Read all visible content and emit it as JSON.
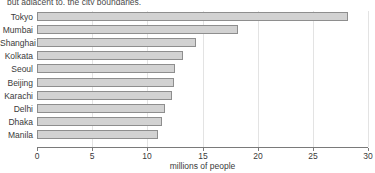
{
  "caption": {
    "text": "but adjacent to, the city boundaries."
  },
  "chart_data": {
    "type": "bar",
    "orientation": "horizontal",
    "title": "",
    "xlabel": "millions of people",
    "ylabel": "",
    "categories": [
      "Tokyo",
      "Mumbai",
      "Shanghai",
      "Kolkata",
      "Seoul",
      "Beijing",
      "Karachi",
      "Delhi",
      "Dhaka",
      "Manila"
    ],
    "values": [
      28.2,
      18.2,
      14.4,
      13.2,
      12.5,
      12.4,
      12.2,
      11.6,
      11.3,
      11.0
    ],
    "xlim": [
      0,
      30
    ],
    "xticks": [
      0,
      5,
      10,
      15,
      20,
      25,
      30
    ],
    "xtick_labels": [
      "0",
      "5",
      "10",
      "15",
      "20",
      "25",
      "30"
    ],
    "grid": "vertical",
    "legend": "none",
    "bar_fill": "#d2d2d2",
    "bar_border": "#8e8e8e",
    "axis_color": "#7a7a7a",
    "grid_color": "#e3e3e3"
  }
}
